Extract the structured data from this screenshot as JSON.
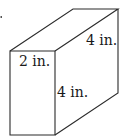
{
  "figure": {
    "type": "rectangular-prism",
    "stroke_color": "#2a2a2a",
    "text_color": "#1a1a1a",
    "dimensions": {
      "width_label": "2 in.",
      "depth_label": "4 in.",
      "height_label": "4 in."
    },
    "vertices": {
      "front_top_left": [
        10,
        51
      ],
      "front_top_right": [
        55,
        51
      ],
      "front_bottom_right": [
        55,
        135
      ],
      "front_bottom_left": [
        10,
        135
      ],
      "back_top_left": [
        73,
        9
      ],
      "back_top_right": [
        118,
        9
      ],
      "back_bottom_right": [
        118,
        93
      ]
    }
  }
}
